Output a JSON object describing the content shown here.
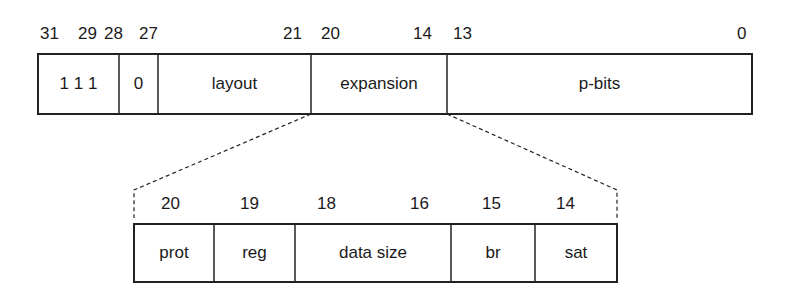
{
  "register": {
    "bit_labels": [
      {
        "text": "31",
        "x": 40
      },
      {
        "text": "29",
        "x": 78
      },
      {
        "text": "28",
        "x": 104
      },
      {
        "text": "27",
        "x": 139
      },
      {
        "text": "21",
        "x": 283
      },
      {
        "text": "20",
        "x": 321
      },
      {
        "text": "14",
        "x": 413
      },
      {
        "text": "13",
        "x": 453
      },
      {
        "text": "0",
        "x": 737
      }
    ],
    "fields": [
      {
        "name": "fixed-bits",
        "label": "1 1 1",
        "x1": 38,
        "x2": 119
      },
      {
        "name": "zero-bit",
        "label": "0",
        "x1": 119,
        "x2": 158
      },
      {
        "name": "layout",
        "label": "layout",
        "x1": 158,
        "x2": 311
      },
      {
        "name": "expansion",
        "label": "expansion",
        "x1": 311,
        "x2": 447
      },
      {
        "name": "p-bits",
        "label": "p-bits",
        "x1": 447,
        "x2": 752
      }
    ]
  },
  "expansion_detail": {
    "bit_labels": [
      {
        "text": "20",
        "x": 161
      },
      {
        "text": "19",
        "x": 240
      },
      {
        "text": "18",
        "x": 317
      },
      {
        "text": "16",
        "x": 410
      },
      {
        "text": "15",
        "x": 482
      },
      {
        "text": "14",
        "x": 556
      }
    ],
    "fields": [
      {
        "name": "prot",
        "label": "prot",
        "x1": 134,
        "x2": 214
      },
      {
        "name": "reg",
        "label": "reg",
        "x1": 214,
        "x2": 295
      },
      {
        "name": "data-size",
        "label": "data size",
        "x1": 295,
        "x2": 451
      },
      {
        "name": "br",
        "label": "br",
        "x1": 451,
        "x2": 535
      },
      {
        "name": "sat",
        "label": "sat",
        "x1": 535,
        "x2": 617
      }
    ]
  },
  "colors": {
    "line": "#222222",
    "text": "#1a1a1a",
    "background": "#ffffff"
  }
}
